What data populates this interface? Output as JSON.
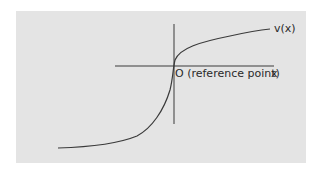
{
  "diagram": {
    "curve_label": "v(x)",
    "origin_label": "O (reference point)",
    "x_axis_label": "x",
    "colors": {
      "panel_background": "#e4e4e4",
      "page_background": "#ffffff",
      "line_color": "#3a3a3a",
      "text_color": "#2a2a2a"
    },
    "elements": {
      "horizontal_axis": {
        "x1": 115,
        "y1": 66,
        "x2": 274,
        "y2": 66
      },
      "vertical_axis": {
        "x1": 174,
        "y1": 24,
        "x2": 174,
        "y2": 124
      },
      "curve_path": "M 58 148 C 90 147, 120 143, 137 136 C 152 128, 164 110, 170 90 C 173 78, 173 68, 175 60 C 180 48, 200 42, 230 36 C 248 32, 260 30, 270 29"
    }
  }
}
